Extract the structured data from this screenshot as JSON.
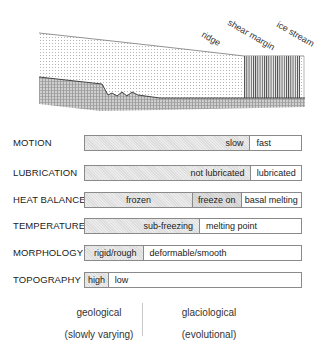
{
  "cross_section": {
    "annotations": [
      {
        "id": "ridge",
        "label": "ridge"
      },
      {
        "id": "shear_margin",
        "label": "shear margin"
      },
      {
        "id": "ice_stream",
        "label": "ice stream"
      }
    ],
    "layers": [
      "ice (stippled)",
      "ice stream (vertical hatch)",
      "bed (cross-hatch)"
    ]
  },
  "rows": [
    {
      "label": "MOTION",
      "segments": [
        {
          "text": "slow",
          "shade": "light",
          "width": 166,
          "align": "right"
        },
        {
          "text": "fast",
          "shade": "none",
          "width": 52,
          "align": "left"
        }
      ]
    },
    {
      "label": "LUBRICATION",
      "segments": [
        {
          "text": "not lubricated",
          "shade": "light",
          "width": 167,
          "align": "right"
        },
        {
          "text": "lubricated",
          "shade": "none",
          "width": 51,
          "align": "center"
        }
      ]
    },
    {
      "label": "HEAT BALANCE",
      "segments": [
        {
          "text": "frozen",
          "shade": "light",
          "width": 108,
          "align": "center"
        },
        {
          "text": "freeze on",
          "shade": "dark",
          "width": 49,
          "align": "center"
        },
        {
          "text": "basal melting",
          "shade": "none",
          "width": 61,
          "align": "center"
        }
      ]
    },
    {
      "label": "TEMPERATURE",
      "segments": [
        {
          "text": "sub-freezing",
          "shade": "light",
          "width": 115,
          "align": "right"
        },
        {
          "text": "melting point",
          "shade": "none",
          "width": 103,
          "align": "left"
        }
      ]
    },
    {
      "label": "MORPHOLOGY",
      "segments": [
        {
          "text": "rigid/rough",
          "shade": "light",
          "width": 58,
          "align": "right"
        },
        {
          "text": "deformable/smooth",
          "shade": "none",
          "width": 160,
          "align": "left"
        }
      ]
    },
    {
      "label": "TOPOGRAPHY",
      "segments": [
        {
          "text": "high",
          "shade": "light",
          "width": 23,
          "align": "center"
        },
        {
          "text": "low",
          "shade": "none",
          "width": 195,
          "align": "left"
        }
      ]
    }
  ],
  "footer": {
    "left_title": "geological",
    "left_sub": "(slowly varying)",
    "right_title": "glaciological",
    "right_sub": "(evolutional)"
  }
}
